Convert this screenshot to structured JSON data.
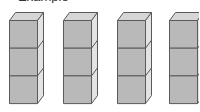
{
  "caption": {
    "text": "Example",
    "visible": "partially-cropped"
  },
  "figure": {
    "tower_count": 4,
    "cubes_per_tower": 3,
    "total_cubes": 12,
    "towers": [
      {
        "index": 1,
        "cubes": 3,
        "front_x": 9,
        "depth_x": 43
      },
      {
        "index": 2,
        "cubes": 3,
        "front_x": 63,
        "depth_x": 98
      },
      {
        "index": 3,
        "cubes": 3,
        "front_x": 117,
        "depth_x": 150
      },
      {
        "index": 4,
        "cubes": 3,
        "front_x": 169,
        "depth_x": 203
      }
    ],
    "colors": {
      "front": "#b9b9b9",
      "top": "#d6d6d6",
      "side": "#e3e3e3",
      "edge": "#5a5a5a",
      "background": "#ffffff"
    }
  }
}
